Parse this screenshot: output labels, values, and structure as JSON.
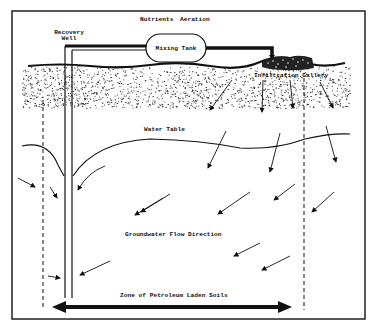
{
  "diagram": {
    "title": "",
    "type": "groundwater remediation schematic",
    "labels": {
      "nutrients": "Nutrients",
      "aeration": "Aeration",
      "recovery_well_line1": "Recovery",
      "recovery_well_line2": "Well",
      "mixing_tank": "Mixing Tank",
      "infiltration_gallery": "Infiltration Gallery",
      "water_table": "Water Table",
      "groundwater_flow": "Groundwater Flow Direction",
      "zone": "Zone of Petroleum Laden Soils"
    },
    "components": [
      {
        "name": "Recovery Well",
        "kind": "vertical pipe"
      },
      {
        "name": "Mixing Tank",
        "kind": "rounded tank",
        "inputs": [
          "Nutrients",
          "Aeration"
        ]
      },
      {
        "name": "Infiltration Gallery",
        "kind": "gravel bed at surface"
      },
      {
        "name": "Water Table",
        "kind": "curved line with cone of depression at well"
      },
      {
        "name": "Zone of Petroleum Laden Soils",
        "kind": "double-headed horizontal arrow between dashed boundaries"
      }
    ],
    "colors": {
      "ink": "#111111",
      "background": "#ffffff"
    }
  }
}
